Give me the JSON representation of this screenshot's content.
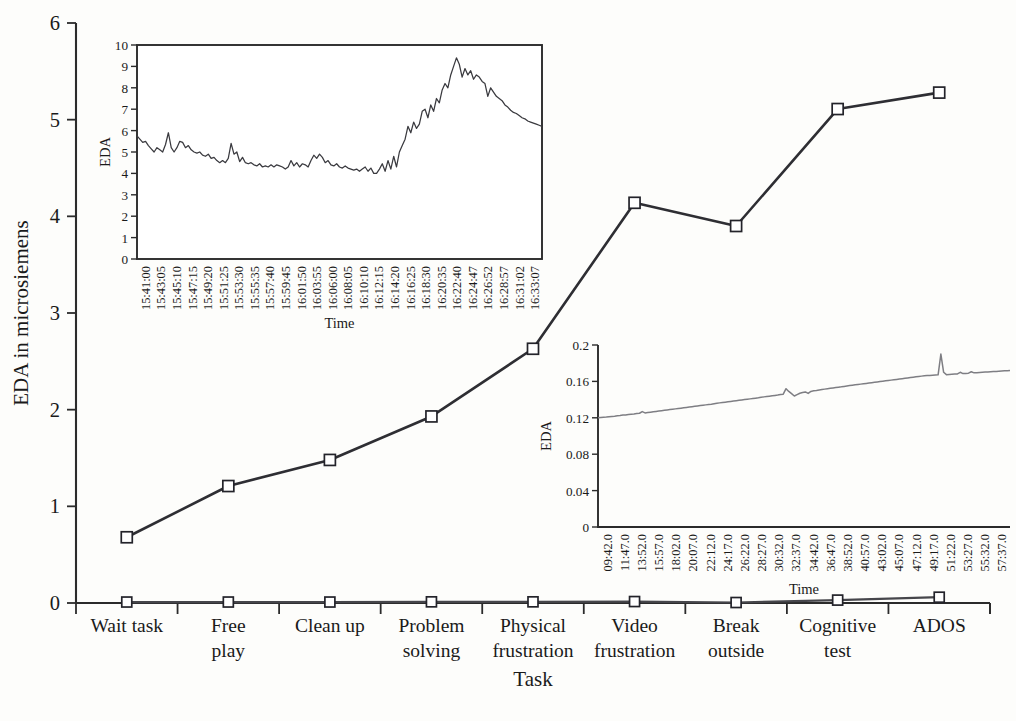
{
  "chart_data": [
    {
      "id": "main",
      "type": "line",
      "title": "",
      "xlabel": "Task",
      "ylabel": "EDA in microsiemens",
      "ylim": [
        0,
        6
      ],
      "yticks": [
        0,
        1,
        2,
        3,
        4,
        5,
        6
      ],
      "ytick_labels": [
        "0",
        "1",
        "2",
        "3",
        "4",
        "5",
        "6"
      ],
      "grid": false,
      "legend": "none",
      "categories": [
        "Wait task",
        "Free play",
        "Clean up",
        "Problem solving",
        "Physical frustration",
        "Video frustration",
        "Break outside",
        "Cognitive test",
        "ADOS"
      ],
      "category_lines": [
        [
          "Wait task"
        ],
        [
          "Free",
          "play"
        ],
        [
          "Clean up"
        ],
        [
          "Problem",
          "solving"
        ],
        [
          "Physical",
          "frustration"
        ],
        [
          "Video",
          "frustration"
        ],
        [
          "Break",
          "outside"
        ],
        [
          "Cognitive",
          "test"
        ],
        [
          "ADOS"
        ]
      ],
      "series": [
        {
          "name": "participant-high-eda",
          "marker": "open-square",
          "values": [
            0.68,
            1.21,
            1.48,
            1.93,
            2.63,
            4.14,
            3.9,
            5.11,
            5.28
          ]
        },
        {
          "name": "participant-low-eda",
          "marker": "open-square",
          "values": [
            0.01,
            0.01,
            0.01,
            0.012,
            0.012,
            0.015,
            0.005,
            0.03,
            0.06
          ]
        }
      ]
    },
    {
      "id": "inset-top-left",
      "type": "line",
      "title": "",
      "xlabel": "Time",
      "ylabel": "EDA",
      "ylim": [
        0,
        10
      ],
      "yticks": [
        0,
        1,
        2,
        3,
        4,
        5,
        6,
        7,
        8,
        9,
        10
      ],
      "ytick_labels": [
        "0",
        "1",
        "2",
        "3",
        "4",
        "5",
        "6",
        "7",
        "8",
        "9",
        "10"
      ],
      "grid": false,
      "legend": "none",
      "tick_labels": [
        "15:41:00",
        "15:43:05",
        "15:45:10",
        "15:47:15",
        "15:49:20",
        "15:51:25",
        "15:53:30",
        "15:55:35",
        "15:57:40",
        "15:59:45",
        "16:01:50",
        "16:03:55",
        "16:06:00",
        "16:08:05",
        "16:10:10",
        "16:12:15",
        "16:14:20",
        "16:16:25",
        "16:18:30",
        "16:20:35",
        "16:22:40",
        "16:24:47",
        "16:26:52",
        "16:28:57",
        "16:31:02",
        "16:33:07"
      ],
      "values": [
        5.75,
        5.6,
        5.45,
        5.5,
        5.3,
        5.15,
        5.0,
        5.2,
        5.1,
        5.0,
        5.35,
        5.9,
        5.2,
        5.0,
        5.2,
        5.5,
        5.45,
        5.2,
        5.3,
        5.1,
        5.0,
        4.95,
        5.0,
        4.85,
        4.8,
        4.9,
        4.7,
        4.75,
        4.6,
        4.5,
        4.6,
        4.5,
        4.7,
        5.4,
        4.9,
        5.0,
        4.55,
        4.75,
        4.5,
        4.45,
        4.5,
        4.4,
        4.35,
        4.45,
        4.3,
        4.35,
        4.3,
        4.4,
        4.3,
        4.4,
        4.35,
        4.3,
        4.2,
        4.3,
        4.6,
        4.35,
        4.5,
        4.3,
        4.45,
        4.4,
        4.3,
        4.6,
        4.85,
        4.7,
        4.9,
        4.75,
        4.5,
        4.6,
        4.4,
        4.35,
        4.45,
        4.3,
        4.25,
        4.35,
        4.25,
        4.2,
        4.15,
        4.2,
        4.1,
        4.2,
        4.3,
        4.1,
        4.25,
        4.0,
        4.0,
        4.2,
        4.45,
        4.1,
        4.6,
        4.2,
        4.8,
        4.3,
        5.0,
        5.3,
        5.6,
        6.2,
        5.9,
        6.4,
        6.1,
        6.3,
        6.9,
        7.0,
        6.6,
        7.2,
        6.9,
        7.5,
        7.3,
        7.9,
        8.2,
        8.0,
        8.6,
        9.0,
        9.4,
        9.1,
        8.5,
        8.9,
        8.6,
        8.8,
        8.4,
        8.6,
        8.5,
        8.3,
        8.2,
        7.6,
        8.0,
        7.8,
        7.6,
        7.5,
        7.4,
        7.2,
        7.1,
        6.95,
        6.85,
        6.8,
        6.7,
        6.6,
        6.55,
        6.45,
        6.4,
        6.35,
        6.3,
        6.25,
        6.2
      ]
    },
    {
      "id": "inset-bottom-right",
      "type": "line",
      "title": "",
      "xlabel": "Time",
      "ylabel": "EDA",
      "ylim": [
        0,
        0.2
      ],
      "yticks": [
        0,
        0.04,
        0.08,
        0.12,
        0.16,
        0.2
      ],
      "ytick_labels": [
        "0",
        "0.04",
        "0.08",
        "0.12",
        "0.16",
        "0.2"
      ],
      "grid": false,
      "legend": "none",
      "tick_labels": [
        "09:42.0",
        "11:47.0",
        "13:52.0",
        "15:57.0",
        "18:02.0",
        "20:07.0",
        "22:12.0",
        "24:17.0",
        "26:22.0",
        "28:27.0",
        "30:32.0",
        "32:37.0",
        "34:42.0",
        "36:47.0",
        "38:52.0",
        "40:57.0",
        "43:02.0",
        "45:07.0",
        "47:12.0",
        "49:17.0",
        "51:22.0",
        "53:27.0",
        "55:32.0",
        "57:37.0"
      ],
      "values": [
        0.12,
        0.1203,
        0.1206,
        0.1208,
        0.1212,
        0.1215,
        0.1218,
        0.1222,
        0.1225,
        0.123,
        0.1232,
        0.1236,
        0.124,
        0.1243,
        0.1247,
        0.125,
        0.1268,
        0.1254,
        0.1258,
        0.1262,
        0.1266,
        0.127,
        0.1274,
        0.1278,
        0.1282,
        0.1286,
        0.129,
        0.1294,
        0.1298,
        0.1302,
        0.1306,
        0.131,
        0.1314,
        0.1318,
        0.1322,
        0.1326,
        0.133,
        0.1334,
        0.1338,
        0.1342,
        0.1346,
        0.135,
        0.1355,
        0.136,
        0.1364,
        0.1368,
        0.1372,
        0.1376,
        0.138,
        0.1384,
        0.1388,
        0.1392,
        0.1396,
        0.14,
        0.1404,
        0.1408,
        0.1412,
        0.1416,
        0.142,
        0.1425,
        0.143,
        0.1434,
        0.1438,
        0.1442,
        0.1446,
        0.145,
        0.1455,
        0.146,
        0.152,
        0.149,
        0.1465,
        0.144,
        0.1455,
        0.147,
        0.1478,
        0.1484,
        0.1468,
        0.149,
        0.1496,
        0.15,
        0.1505,
        0.151,
        0.1515,
        0.152,
        0.1524,
        0.1528,
        0.1532,
        0.1536,
        0.154,
        0.1545,
        0.155,
        0.1554,
        0.1558,
        0.1562,
        0.1566,
        0.157,
        0.1574,
        0.1578,
        0.1582,
        0.1586,
        0.159,
        0.1594,
        0.1598,
        0.1602,
        0.1606,
        0.161,
        0.1614,
        0.1618,
        0.1622,
        0.1626,
        0.163,
        0.1634,
        0.1638,
        0.1642,
        0.1646,
        0.165,
        0.1654,
        0.1658,
        0.1662,
        0.1664,
        0.1666,
        0.1668,
        0.167,
        0.1672,
        0.19,
        0.17,
        0.1674,
        0.1676,
        0.1678,
        0.168,
        0.1682,
        0.17,
        0.1686,
        0.1688,
        0.169,
        0.1706,
        0.1694,
        0.1696,
        0.1698,
        0.17,
        0.1702,
        0.1704,
        0.1706,
        0.1708,
        0.171,
        0.1712,
        0.1714,
        0.1716,
        0.1718,
        0.172
      ]
    }
  ],
  "colors": {
    "line_main": "#2e2e33",
    "line_flat": "#46464b",
    "marker_fill": "#ffffff",
    "marker_stroke": "#23232a",
    "axis": "#2b2b2b",
    "wave_inset1": "#3a3a3f",
    "wave_inset2": "#7e7e83",
    "background": "#fdfdfb"
  }
}
